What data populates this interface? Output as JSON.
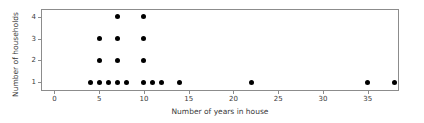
{
  "chart_data": {
    "type": "scatter",
    "title": "",
    "xlabel": "Number of years in house",
    "ylabel": "Number of households",
    "xlim": [
      -1.5,
      38.5
    ],
    "ylim": [
      0.6,
      4.35
    ],
    "grid": false,
    "legend": null,
    "xticks": [
      0,
      5,
      10,
      15,
      20,
      25,
      30,
      35
    ],
    "xticklabels": [
      "0",
      "5",
      "10",
      "15",
      "20",
      "25",
      "30",
      "35"
    ],
    "yticks": [
      1,
      2,
      3,
      4
    ],
    "yticklabels": [
      "1",
      "2",
      "3",
      "4"
    ],
    "marker": {
      "shape": "circle",
      "color": "#000000",
      "size": 5
    },
    "points": [
      {
        "x": 4,
        "y": 1
      },
      {
        "x": 5,
        "y": 1
      },
      {
        "x": 6,
        "y": 1
      },
      {
        "x": 7,
        "y": 1
      },
      {
        "x": 8,
        "y": 1
      },
      {
        "x": 10,
        "y": 1
      },
      {
        "x": 11,
        "y": 1
      },
      {
        "x": 12,
        "y": 1
      },
      {
        "x": 14,
        "y": 1
      },
      {
        "x": 22,
        "y": 1
      },
      {
        "x": 35,
        "y": 1
      },
      {
        "x": 38,
        "y": 1
      },
      {
        "x": 5,
        "y": 2
      },
      {
        "x": 7,
        "y": 2
      },
      {
        "x": 10,
        "y": 2
      },
      {
        "x": 5,
        "y": 3
      },
      {
        "x": 7,
        "y": 3
      },
      {
        "x": 10,
        "y": 3
      },
      {
        "x": 7,
        "y": 4
      },
      {
        "x": 10,
        "y": 4
      }
    ],
    "x": [
      4,
      5,
      6,
      7,
      8,
      10,
      11,
      12,
      14,
      22,
      35,
      38,
      5,
      7,
      10,
      5,
      7,
      10,
      7,
      10
    ],
    "values": [
      1,
      1,
      1,
      1,
      1,
      1,
      1,
      1,
      1,
      1,
      1,
      1,
      2,
      2,
      2,
      3,
      3,
      3,
      4,
      4
    ],
    "colors": {
      "marker": "#000000",
      "axis": "#8c8c8c",
      "text": "#3a3a3a",
      "background": "#ffffff"
    }
  }
}
